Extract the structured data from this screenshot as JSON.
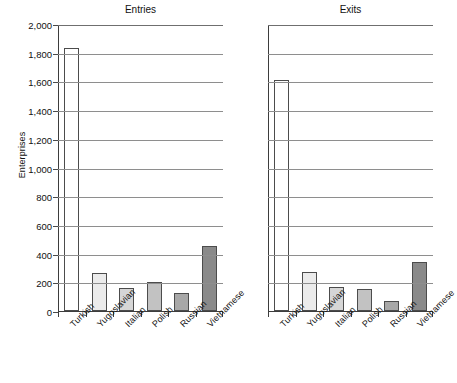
{
  "chart_data": {
    "type": "bar",
    "title": "",
    "xlabel": "",
    "ylabel": "Enterprises",
    "ylim": [
      0,
      2000
    ],
    "ytick_step": 200,
    "ytick_labels": [
      "0",
      "200",
      "400",
      "600",
      "800",
      "1,000",
      "1,200",
      "1,400",
      "1,600",
      "1,800",
      "2,000"
    ],
    "ytick_values": [
      0,
      200,
      400,
      600,
      800,
      1000,
      1200,
      1400,
      1600,
      1800,
      2000
    ],
    "grid": "horizontal",
    "legend": "none",
    "categories": [
      "Turkish",
      "Yugoslavian",
      "Italian",
      "Polish",
      "Russian",
      "Vietnamese"
    ],
    "panels": [
      {
        "title": "Entries",
        "values": [
          1830,
          265,
          160,
          200,
          125,
          455
        ]
      },
      {
        "title": "Exits",
        "values": [
          1610,
          275,
          170,
          150,
          70,
          340
        ]
      }
    ],
    "series": [
      {
        "name": "Entries",
        "values": [
          1830,
          265,
          160,
          200,
          125,
          455
        ]
      },
      {
        "name": "Exits",
        "values": [
          1610,
          275,
          170,
          150,
          70,
          340
        ]
      }
    ],
    "bar_colors": [
      "#ffffff",
      "#ebebeb",
      "#d6d6d6",
      "#c2c2c2",
      "#a8a8a8",
      "#8a8a8a"
    ],
    "bar_edge_color": "#4c4c4c",
    "grid_color": "#8e8e8e",
    "axis_color": "#3d3d3d",
    "text_color": "#111111"
  }
}
